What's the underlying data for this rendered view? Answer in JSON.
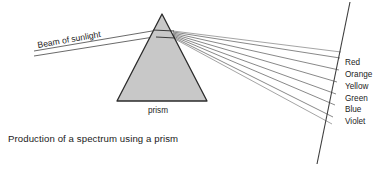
{
  "figure": {
    "title": "Production of a spectrum using a prism",
    "caption": "Production of a spectrum using a prism",
    "background_color": "#ffffff",
    "line_color": "#3c3c3c",
    "prism": {
      "label": "prism",
      "fill_color": "#c8c8c8",
      "stroke_color": "#2b2b2b",
      "apex": {
        "x": 162,
        "y": 14
      },
      "base_left": {
        "x": 117,
        "y": 101
      },
      "base_right": {
        "x": 207,
        "y": 101
      }
    },
    "incident_beam": {
      "label": "Beam of sunlight",
      "label_rotation_deg": -10,
      "start": {
        "x": 33,
        "y": 54
      },
      "end": {
        "x": 157,
        "y": 32
      }
    },
    "screen": {
      "label": "",
      "top": {
        "x": 350,
        "y": 2
      },
      "bottom": {
        "x": 317,
        "y": 164
      }
    },
    "spectrum": {
      "origin": {
        "x": 173,
        "y": 33
      },
      "rays": [
        {
          "label": "Red",
          "end_x": 340,
          "end_y": 58,
          "label_x": 345,
          "label_y": 65
        },
        {
          "label": "Orange",
          "end_x": 339,
          "end_y": 70,
          "label_x": 345,
          "label_y": 77
        },
        {
          "label": "Yellow",
          "end_x": 337,
          "end_y": 82,
          "label_x": 345,
          "label_y": 89
        },
        {
          "label": "Green",
          "end_x": 336,
          "end_y": 94,
          "label_x": 345,
          "label_y": 101
        },
        {
          "label": "Blue",
          "end_x": 335,
          "end_y": 105,
          "label_x": 345,
          "label_y": 112
        },
        {
          "label": "Violet",
          "end_x": 333,
          "end_y": 117,
          "label_x": 345,
          "label_y": 124
        }
      ]
    }
  }
}
